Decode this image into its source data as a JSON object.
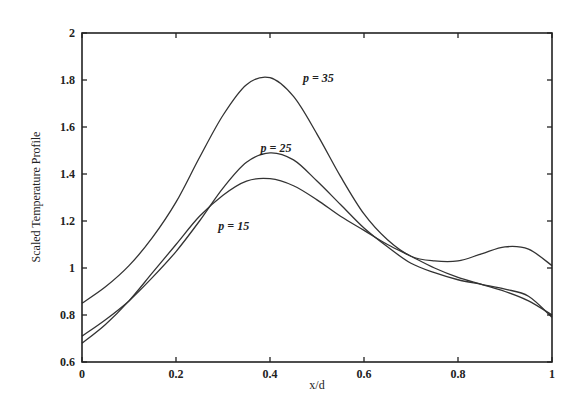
{
  "chart_data": {
    "type": "line",
    "title": "",
    "xlabel": "x/d",
    "ylabel": "Scaled Temperature Profile",
    "xlim": [
      0,
      1
    ],
    "ylim": [
      0.6,
      2
    ],
    "grid": false,
    "legend": "none (inline curve labels)",
    "x_ticks": [
      "0",
      "0.2",
      "0.4",
      "0.6",
      "0.8",
      "1"
    ],
    "y_ticks": [
      "0.6",
      "0.8",
      "1",
      "1.2",
      "1.4",
      "1.6",
      "1.8",
      "2"
    ],
    "x": [
      0,
      0.05,
      0.1,
      0.15,
      0.2,
      0.25,
      0.3,
      0.35,
      0.4,
      0.45,
      0.5,
      0.55,
      0.6,
      0.65,
      0.7,
      0.75,
      0.8,
      0.85,
      0.9,
      0.95,
      1.0
    ],
    "series": [
      {
        "name": "p = 35",
        "label_pos": [
          0.47,
          1.81
        ],
        "values": [
          0.85,
          0.92,
          1.01,
          1.13,
          1.28,
          1.47,
          1.65,
          1.78,
          1.81,
          1.73,
          1.57,
          1.39,
          1.23,
          1.12,
          1.05,
          1.03,
          1.03,
          1.06,
          1.09,
          1.08,
          1.01
        ]
      },
      {
        "name": "p = 25",
        "label_pos": [
          0.38,
          1.51
        ],
        "values": [
          0.71,
          0.78,
          0.86,
          0.96,
          1.07,
          1.2,
          1.34,
          1.45,
          1.49,
          1.46,
          1.37,
          1.27,
          1.17,
          1.09,
          1.02,
          0.98,
          0.95,
          0.93,
          0.91,
          0.88,
          0.79
        ]
      },
      {
        "name": "p = 15",
        "label_pos": [
          0.29,
          1.18
        ],
        "values": [
          0.68,
          0.76,
          0.86,
          0.98,
          1.1,
          1.22,
          1.31,
          1.37,
          1.38,
          1.35,
          1.29,
          1.22,
          1.16,
          1.1,
          1.05,
          1.0,
          0.96,
          0.93,
          0.9,
          0.86,
          0.8
        ]
      }
    ]
  }
}
